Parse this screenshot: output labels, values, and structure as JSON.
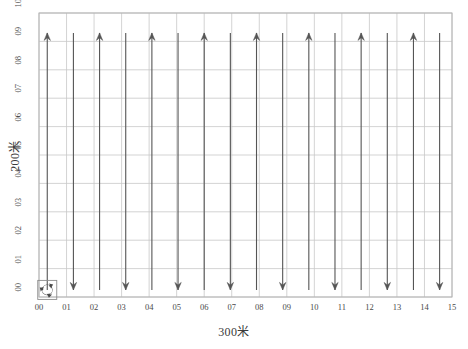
{
  "figure": {
    "kind": "coverage-path-plot",
    "background_color": "#ffffff"
  },
  "chart_data": {
    "type": "line",
    "title": "",
    "subtitle": "",
    "xlabel": "300米",
    "ylabel": "200米",
    "xlim": [
      0,
      15
    ],
    "ylim": [
      0,
      10
    ],
    "xticks": [
      "00",
      "01",
      "02",
      "03",
      "04",
      "05",
      "06",
      "07",
      "08",
      "09",
      "10",
      "11",
      "12",
      "13",
      "14",
      "15"
    ],
    "yticks": [
      "00",
      "01",
      "02",
      "03",
      "04",
      "05",
      "06",
      "07",
      "08",
      "09",
      "10"
    ],
    "xtick_values": [
      0,
      1,
      2,
      3,
      4,
      5,
      6,
      7,
      8,
      9,
      10,
      11,
      12,
      13,
      14,
      15
    ],
    "ytick_values": [
      0,
      1,
      2,
      3,
      4,
      5,
      6,
      7,
      8,
      9,
      10
    ],
    "grid": true,
    "grid_color": "#c8c8c8",
    "axes_color": "#b4b4b4",
    "legend": null,
    "legend_position": "none",
    "series": [
      {
        "name": "coverage-path",
        "color": "#555555",
        "pattern": "boustrophedon",
        "sweep_count": 16,
        "y_bottom": 0.25,
        "y_top": 9.3,
        "passes": [
          {
            "index": 0,
            "x": 0.3,
            "direction": "up"
          },
          {
            "index": 1,
            "x": 1.25,
            "direction": "down"
          },
          {
            "index": 2,
            "x": 2.2,
            "direction": "up"
          },
          {
            "index": 3,
            "x": 3.15,
            "direction": "down"
          },
          {
            "index": 4,
            "x": 4.1,
            "direction": "up"
          },
          {
            "index": 5,
            "x": 5.05,
            "direction": "down"
          },
          {
            "index": 6,
            "x": 6.0,
            "direction": "up"
          },
          {
            "index": 7,
            "x": 6.95,
            "direction": "down"
          },
          {
            "index": 8,
            "x": 7.9,
            "direction": "up"
          },
          {
            "index": 9,
            "x": 8.85,
            "direction": "down"
          },
          {
            "index": 10,
            "x": 9.8,
            "direction": "up"
          },
          {
            "index": 11,
            "x": 10.75,
            "direction": "down"
          },
          {
            "index": 12,
            "x": 11.7,
            "direction": "up"
          },
          {
            "index": 13,
            "x": 12.65,
            "direction": "down"
          },
          {
            "index": 14,
            "x": 13.6,
            "direction": "up"
          },
          {
            "index": 15,
            "x": 14.55,
            "direction": "down"
          }
        ]
      }
    ],
    "markers": [
      {
        "name": "start-marker",
        "icon": "rotate-refresh-icon",
        "x": 0.3,
        "y": 0.25,
        "color": "#4a4a4a"
      }
    ],
    "annotations": []
  }
}
